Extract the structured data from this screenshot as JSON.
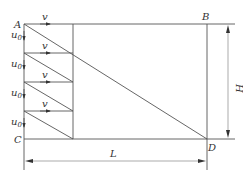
{
  "diagram": {
    "points": {
      "A": "A",
      "B": "B",
      "C": "C",
      "D": "D"
    },
    "velocity_label": "v",
    "vertical_velocity_label": "u",
    "vertical_velocity_subscript": "0",
    "dimension_height": "H",
    "dimension_length": "L",
    "colors": {
      "line": "#555555",
      "text": "#333333",
      "background": "#ffffff"
    }
  }
}
